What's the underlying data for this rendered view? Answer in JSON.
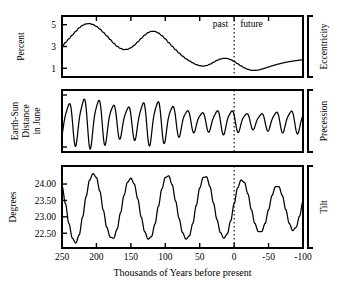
{
  "figure": {
    "xlabel": "Thousands of Years before present",
    "past_label": "past",
    "future_label": "future",
    "divider_value": 0
  },
  "panels": [
    {
      "key": "eccentricity",
      "left_label": "Percent",
      "right_label": "Eccentricity",
      "yticks": [
        "5",
        "3",
        "1"
      ],
      "ytick_values": [
        5,
        3,
        1
      ],
      "ylim": [
        0.2,
        5.8
      ]
    },
    {
      "key": "precession",
      "left_label": "Earth-Sun\nDistance\nin June",
      "left_label_lines": [
        "Earth-Sun",
        "Distance",
        "in June"
      ],
      "right_label": "Precession",
      "yticks": [],
      "ylim": [
        -1.25,
        1.25
      ]
    },
    {
      "key": "tilt",
      "left_label": "Degrees",
      "right_label": "Tilt",
      "yticks": [
        "24.00",
        "23.50",
        "23.00",
        "22.50"
      ],
      "ytick_values": [
        24.0,
        23.5,
        23.0,
        22.5
      ],
      "ylim": [
        22.05,
        24.55
      ]
    }
  ],
  "chart_data": {
    "type": "line",
    "title": "",
    "xlabel": "Thousands of Years before present",
    "ylabel": "",
    "xlim": [
      250,
      -100
    ],
    "xticks": [
      250,
      200,
      150,
      100,
      50,
      0,
      -50,
      -100
    ],
    "xticklabels": [
      "250",
      "200",
      "150",
      "100",
      "50",
      "0",
      "-50",
      "-100"
    ],
    "x_axis_direction": "decreasing",
    "grid": false,
    "legend": null,
    "annotations": [
      {
        "text": "past",
        "x": 18,
        "panel": "eccentricity"
      },
      {
        "text": "future",
        "x": -22,
        "panel": "eccentricity"
      },
      {
        "text": "dotted vertical divider",
        "x": 0
      }
    ],
    "series": [
      {
        "name": "Eccentricity",
        "panel": "eccentricity",
        "ylabel": "Percent",
        "ylim": [
          0.2,
          5.8
        ],
        "yticks": [
          5,
          3,
          1
        ],
        "units": "percent",
        "x": [
          250,
          245,
          240,
          235,
          230,
          225,
          220,
          215,
          210,
          205,
          200,
          195,
          190,
          185,
          180,
          175,
          170,
          165,
          160,
          155,
          150,
          145,
          140,
          135,
          130,
          125,
          120,
          115,
          110,
          105,
          100,
          95,
          90,
          85,
          80,
          75,
          70,
          65,
          60,
          55,
          50,
          45,
          40,
          35,
          30,
          25,
          20,
          15,
          10,
          5,
          0,
          -5,
          -10,
          -15,
          -20,
          -25,
          -30,
          -35,
          -40,
          -45,
          -50,
          -55,
          -60,
          -65,
          -70,
          -75,
          -80,
          -85,
          -90,
          -95,
          -100
        ],
        "y": [
          3.0,
          3.35,
          3.7,
          4.05,
          4.4,
          4.72,
          4.95,
          5.08,
          5.1,
          5.02,
          4.85,
          4.6,
          4.3,
          3.98,
          3.64,
          3.3,
          3.02,
          2.82,
          2.72,
          2.74,
          2.88,
          3.12,
          3.42,
          3.74,
          4.04,
          4.28,
          4.4,
          4.38,
          4.24,
          4.0,
          3.7,
          3.36,
          3.02,
          2.7,
          2.4,
          2.12,
          1.88,
          1.68,
          1.5,
          1.34,
          1.24,
          1.2,
          1.25,
          1.38,
          1.55,
          1.72,
          1.85,
          1.92,
          1.9,
          1.8,
          1.62,
          1.42,
          1.22,
          1.04,
          0.9,
          0.82,
          0.8,
          0.84,
          0.92,
          1.02,
          1.12,
          1.22,
          1.32,
          1.4,
          1.48,
          1.55,
          1.61,
          1.66,
          1.71,
          1.75,
          1.78
        ]
      },
      {
        "name": "Precession",
        "panel": "precession",
        "ylabel": "Earth-Sun Distance in June",
        "ylim": [
          -1.25,
          1.25
        ],
        "yticks": [],
        "units": "relative",
        "description": "Quasi-periodic ~21 kyr oscillation whose amplitude is modulated by the eccentricity envelope",
        "period_kyr": 21.5,
        "amplitude_envelope_source": "Eccentricity"
      },
      {
        "name": "Tilt",
        "panel": "tilt",
        "ylabel": "Degrees",
        "ylim": [
          22.05,
          24.55
        ],
        "yticks": [
          24.0,
          23.5,
          23.0,
          22.5
        ],
        "units": "degrees",
        "period_kyr": 41,
        "mean": 23.3,
        "amplitude": 1.05,
        "x": [
          250,
          245,
          240,
          235,
          230,
          225,
          220,
          215,
          210,
          205,
          200,
          195,
          190,
          185,
          180,
          175,
          170,
          165,
          160,
          155,
          150,
          145,
          140,
          135,
          130,
          125,
          120,
          115,
          110,
          105,
          100,
          95,
          90,
          85,
          80,
          75,
          70,
          65,
          60,
          55,
          50,
          45,
          40,
          35,
          30,
          25,
          20,
          15,
          10,
          5,
          0,
          -5,
          -10,
          -15,
          -20,
          -25,
          -30,
          -35,
          -40,
          -45,
          -50,
          -55,
          -60,
          -65,
          -70,
          -75,
          -80,
          -85,
          -90,
          -95,
          -100
        ],
        "y": [
          23.95,
          23.4,
          22.8,
          22.35,
          22.2,
          22.45,
          23.0,
          23.62,
          24.12,
          24.32,
          24.2,
          23.78,
          23.2,
          22.68,
          22.38,
          22.35,
          22.62,
          23.12,
          23.65,
          24.05,
          24.18,
          24.0,
          23.55,
          23.0,
          22.55,
          22.32,
          22.4,
          22.78,
          23.32,
          23.85,
          24.2,
          24.25,
          23.98,
          23.48,
          22.95,
          22.52,
          22.32,
          22.42,
          22.8,
          23.35,
          23.88,
          24.2,
          24.22,
          23.92,
          23.42,
          22.92,
          22.52,
          22.35,
          22.48,
          22.88,
          23.4,
          23.88,
          24.12,
          24.05,
          23.7,
          23.22,
          22.8,
          22.55,
          22.55,
          22.8,
          23.22,
          23.65,
          23.92,
          23.92,
          23.65,
          23.22,
          22.8,
          22.58,
          22.68,
          23.02,
          23.48
        ]
      }
    ]
  }
}
